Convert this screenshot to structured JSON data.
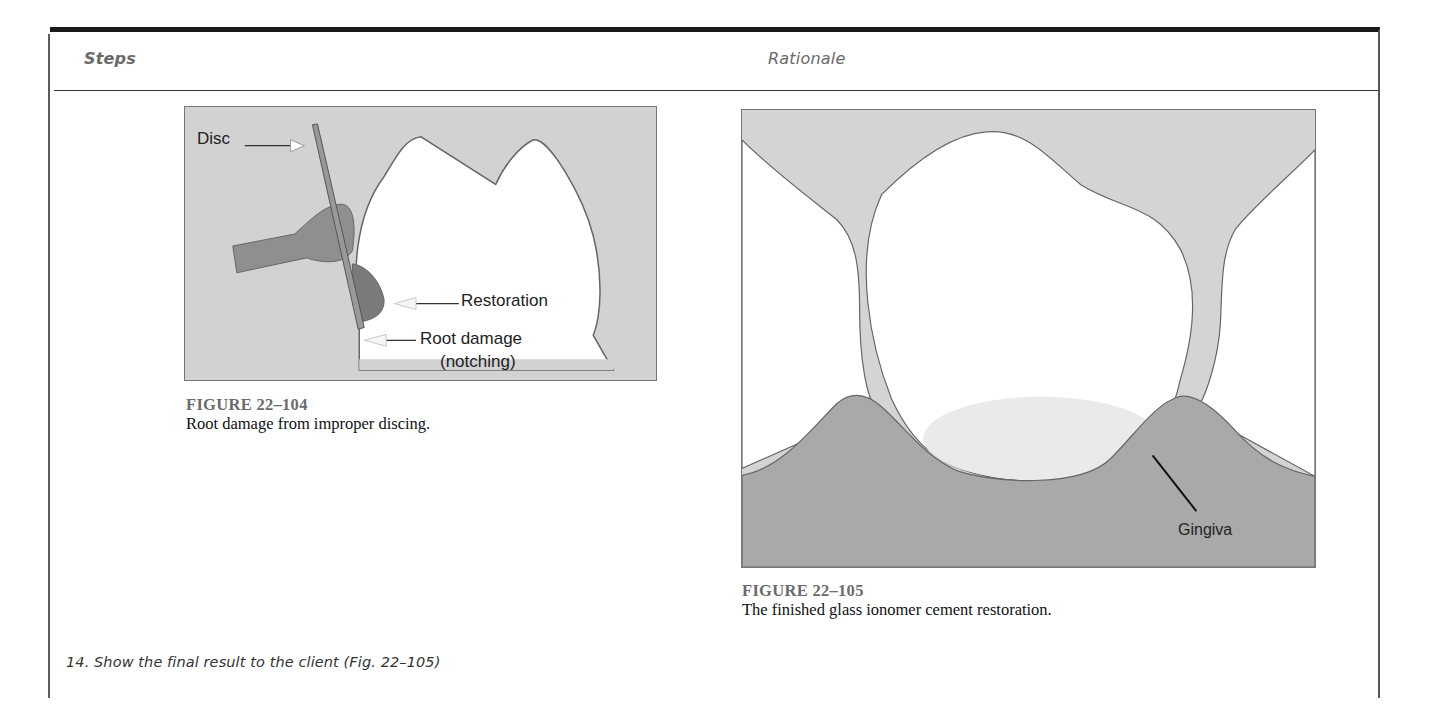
{
  "header": {
    "steps_title": "Steps",
    "rationale_title": "Rationale"
  },
  "figure_104": {
    "number": "FIGURE 22–104",
    "caption": "Root damage from improper discing.",
    "labels": {
      "disc": "Disc",
      "restoration": "Restoration",
      "root_damage": "Root damage",
      "notching": "(notching)"
    }
  },
  "figure_105": {
    "number": "FIGURE 22–105",
    "caption": "The finished glass ionomer cement restoration.",
    "labels": {
      "gingiva": "Gingiva"
    }
  },
  "step": {
    "text": "14.  Show the final result to the client (Fig. 22–105)"
  },
  "colors": {
    "background_gray": "#d4d4d4",
    "gingiva_gray": "#a8a8a8",
    "tooth_white": "#ffffff",
    "instrument_gray": "#8e8e8e",
    "caption_number_gray": "#6b6b6b",
    "frame_dark": "#1a1a1a"
  }
}
